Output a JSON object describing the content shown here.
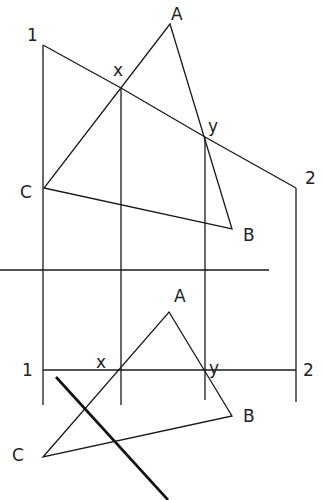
{
  "labels": {
    "top": {
      "one": "1",
      "two": "2",
      "a": "A",
      "b": "B",
      "c": "C",
      "x": "x",
      "y": "y"
    },
    "bottom": {
      "one": "1",
      "two": "2",
      "a": "A",
      "b": "B",
      "c": "C",
      "x": "x",
      "y": "y"
    }
  },
  "colors": {
    "line": "#1a1a1a",
    "background": "#ffffff"
  }
}
